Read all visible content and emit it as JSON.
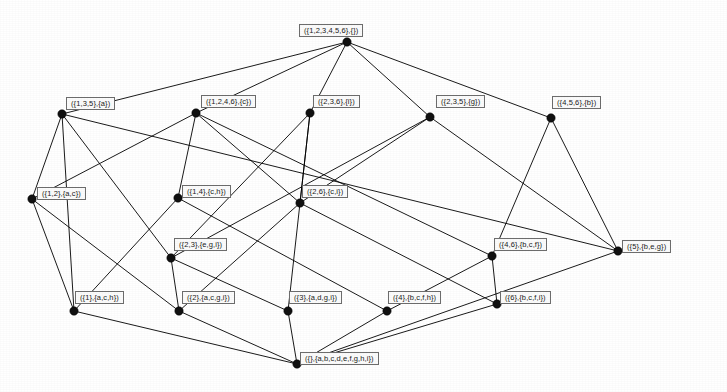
{
  "figure": {
    "kind": "concept-lattice-hasse-diagram",
    "width": 727,
    "height": 392,
    "background_color": "#ffffff",
    "edge_color": "#000000",
    "node_dot_color": "#111111",
    "label_border_color": "#6d6d6d",
    "label_fill_color": "#fbfbfb",
    "label_text_color": "#1a1a1a"
  },
  "nodes": [
    {
      "id": "top",
      "label": "({1,2,3,4,5,6},{})",
      "extent": [
        1,
        2,
        3,
        4,
        5,
        6
      ],
      "intent": [],
      "level": 0,
      "x": 347,
      "y": 42,
      "label_x": 299,
      "label_y": 24
    },
    {
      "id": "n135a",
      "label": "({1,3,5},{a})",
      "extent": [
        1,
        3,
        5
      ],
      "intent": [
        "a"
      ],
      "level": 1,
      "x": 62,
      "y": 114,
      "label_x": 66,
      "label_y": 97
    },
    {
      "id": "n1246c",
      "label": "({1,2,4,6},{c})",
      "extent": [
        1,
        2,
        4,
        6
      ],
      "intent": [
        "c"
      ],
      "level": 1,
      "x": 196,
      "y": 113,
      "label_x": 201,
      "label_y": 95
    },
    {
      "id": "n236i",
      "label": "({2,3,6},{i})",
      "extent": [
        2,
        3,
        6
      ],
      "intent": [
        "i"
      ],
      "level": 1,
      "x": 310,
      "y": 113,
      "label_x": 313,
      "label_y": 95
    },
    {
      "id": "n235g",
      "label": "({2,3,5},{g})",
      "extent": [
        2,
        3,
        5
      ],
      "intent": [
        "g"
      ],
      "level": 1,
      "x": 430,
      "y": 117,
      "label_x": 436,
      "label_y": 95
    },
    {
      "id": "n456b",
      "label": "({4,5,6},{b})",
      "extent": [
        4,
        5,
        6
      ],
      "intent": [
        "b"
      ],
      "level": 1,
      "x": 551,
      "y": 118,
      "label_x": 552,
      "label_y": 96
    },
    {
      "id": "n12ac",
      "label": "({1,2},{a,c})",
      "extent": [
        1,
        2
      ],
      "intent": [
        "a",
        "c"
      ],
      "level": 2,
      "x": 32,
      "y": 199,
      "label_x": 37,
      "label_y": 187
    },
    {
      "id": "n14ch",
      "label": "({1,4},{c,h})",
      "extent": [
        1,
        4
      ],
      "intent": [
        "c",
        "h"
      ],
      "level": 2,
      "x": 178,
      "y": 198,
      "label_x": 182,
      "label_y": 185
    },
    {
      "id": "n26ci",
      "label": "({2,6},{c,i})",
      "extent": [
        2,
        6
      ],
      "intent": [
        "c",
        "i"
      ],
      "level": 2,
      "x": 300,
      "y": 203,
      "label_x": 302,
      "label_y": 185
    },
    {
      "id": "n23egi",
      "label": "({2,3},{e,g,i})",
      "extent": [
        2,
        3
      ],
      "intent": [
        "e",
        "g",
        "i"
      ],
      "level": 3,
      "x": 171,
      "y": 258,
      "label_x": 174,
      "label_y": 238
    },
    {
      "id": "n46bcf",
      "label": "({4,6},{b,c,f})",
      "extent": [
        4,
        6
      ],
      "intent": [
        "b",
        "c",
        "f"
      ],
      "level": 3,
      "x": 492,
      "y": 256,
      "label_x": 494,
      "label_y": 238
    },
    {
      "id": "n5beg",
      "label": "({5},{b,e,g})",
      "extent": [
        5
      ],
      "intent": [
        "b",
        "e",
        "g"
      ],
      "level": 3,
      "x": 618,
      "y": 251,
      "label_x": 622,
      "label_y": 240
    },
    {
      "id": "n1ach",
      "label": "({1},{a,c,h})",
      "extent": [
        1
      ],
      "intent": [
        "a",
        "c",
        "h"
      ],
      "level": 4,
      "x": 74,
      "y": 311,
      "label_x": 75,
      "label_y": 291
    },
    {
      "id": "n2acgi",
      "label": "({2},{a,c,g,i})",
      "extent": [
        2
      ],
      "intent": [
        "a",
        "c",
        "g",
        "i"
      ],
      "level": 4,
      "x": 179,
      "y": 311,
      "label_x": 182,
      "label_y": 291
    },
    {
      "id": "n3adgi",
      "label": "({3},{a,d,g,i})",
      "extent": [
        3
      ],
      "intent": [
        "a",
        "d",
        "g",
        "i"
      ],
      "level": 4,
      "x": 288,
      "y": 311,
      "label_x": 289,
      "label_y": 291
    },
    {
      "id": "n4bcfh",
      "label": "({4},{b,c,f,h})",
      "extent": [
        4
      ],
      "intent": [
        "b",
        "c",
        "f",
        "h"
      ],
      "level": 4,
      "x": 387,
      "y": 311,
      "label_x": 388,
      "label_y": 291
    },
    {
      "id": "n6bcfi",
      "label": "({6},{b,c,f,i})",
      "extent": [
        6
      ],
      "intent": [
        "b",
        "c",
        "f",
        "i"
      ],
      "level": 4,
      "x": 497,
      "y": 304,
      "label_x": 500,
      "label_y": 291
    },
    {
      "id": "bottom",
      "label": "({},{a,b,c,d,e,f,g,h,i})",
      "extent": [],
      "intent": [
        "a",
        "b",
        "c",
        "d",
        "e",
        "f",
        "g",
        "h",
        "i"
      ],
      "level": 5,
      "x": 297,
      "y": 364,
      "label_x": 300,
      "label_y": 352
    }
  ],
  "edges": [
    {
      "from": "top",
      "to": "n135a"
    },
    {
      "from": "top",
      "to": "n1246c"
    },
    {
      "from": "top",
      "to": "n236i"
    },
    {
      "from": "top",
      "to": "n235g"
    },
    {
      "from": "top",
      "to": "n456b"
    },
    {
      "from": "n135a",
      "to": "n12ac"
    },
    {
      "from": "n135a",
      "to": "n1ach"
    },
    {
      "from": "n135a",
      "to": "n23egi"
    },
    {
      "from": "n135a",
      "to": "n5beg"
    },
    {
      "from": "n1246c",
      "to": "n12ac"
    },
    {
      "from": "n1246c",
      "to": "n14ch"
    },
    {
      "from": "n1246c",
      "to": "n26ci"
    },
    {
      "from": "n1246c",
      "to": "n46bcf"
    },
    {
      "from": "n236i",
      "to": "n26ci"
    },
    {
      "from": "n236i",
      "to": "n23egi"
    },
    {
      "from": "n236i",
      "to": "n3adgi"
    },
    {
      "from": "n235g",
      "to": "n23egi"
    },
    {
      "from": "n235g",
      "to": "n5beg"
    },
    {
      "from": "n235g",
      "to": "n26ci"
    },
    {
      "from": "n456b",
      "to": "n46bcf"
    },
    {
      "from": "n456b",
      "to": "n5beg"
    },
    {
      "from": "n12ac",
      "to": "n1ach"
    },
    {
      "from": "n12ac",
      "to": "n2acgi"
    },
    {
      "from": "n14ch",
      "to": "n1ach"
    },
    {
      "from": "n14ch",
      "to": "n4bcfh"
    },
    {
      "from": "n26ci",
      "to": "n2acgi"
    },
    {
      "from": "n26ci",
      "to": "n6bcfi"
    },
    {
      "from": "n23egi",
      "to": "n2acgi"
    },
    {
      "from": "n23egi",
      "to": "n3adgi"
    },
    {
      "from": "n46bcf",
      "to": "n4bcfh"
    },
    {
      "from": "n46bcf",
      "to": "n6bcfi"
    },
    {
      "from": "n5beg",
      "to": "bottom"
    },
    {
      "from": "n1ach",
      "to": "bottom"
    },
    {
      "from": "n2acgi",
      "to": "bottom"
    },
    {
      "from": "n3adgi",
      "to": "bottom"
    },
    {
      "from": "n4bcfh",
      "to": "bottom"
    },
    {
      "from": "n6bcfi",
      "to": "bottom"
    }
  ]
}
